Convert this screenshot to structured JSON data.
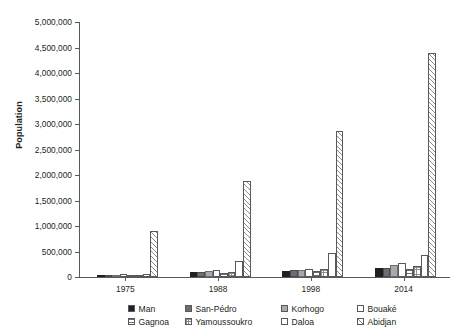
{
  "chart_data": {
    "type": "bar",
    "title": "",
    "xlabel": "",
    "ylabel": "Population",
    "categories": [
      "1975",
      "1988",
      "1998",
      "2014"
    ],
    "ylim": [
      0,
      5000000
    ],
    "ytick_values": [
      0,
      500000,
      1000000,
      1500000,
      2000000,
      2500000,
      3000000,
      3500000,
      4000000,
      4500000,
      5000000
    ],
    "ytick_labels": [
      "0",
      "500,000",
      "1,000,000",
      "1,500,000",
      "2,000,000",
      "2,500,000",
      "3,000,000",
      "3,500,000",
      "4,000,000",
      "4,500,000",
      "5,000,000"
    ],
    "grid": false,
    "legend_position": "bottom",
    "series": [
      {
        "name": "Man",
        "pattern": "solid-black",
        "values": [
          40000,
          90000,
          120000,
          180000
        ]
      },
      {
        "name": "San-Pédro",
        "pattern": "dark-gray",
        "values": [
          35000,
          100000,
          130000,
          175000
        ]
      },
      {
        "name": "Korhogo",
        "pattern": "mid-gray",
        "values": [
          45000,
          110000,
          145000,
          245000
        ]
      },
      {
        "name": "Bouaké",
        "pattern": "white",
        "values": [
          50000,
          130000,
          160000,
          275000
        ]
      },
      {
        "name": "Gagnoa",
        "pattern": "h-lines",
        "values": [
          30000,
          85000,
          125000,
          165000
        ]
      },
      {
        "name": "Yamoussoukro",
        "pattern": "crosshatch",
        "values": [
          30000,
          95000,
          155000,
          215000
        ]
      },
      {
        "name": "Daloa",
        "pattern": "white",
        "values": [
          60000,
          305000,
          465000,
          430000
        ]
      },
      {
        "name": "Abidjan",
        "pattern": "diagonal",
        "values": [
          900000,
          1880000,
          2860000,
          4390000
        ]
      }
    ]
  },
  "legend": {
    "row1": [
      "Man",
      "San-Pédro",
      "Korhogo",
      "Bouaké"
    ],
    "row2": [
      "Gagnoa",
      "Yamoussoukro",
      "Daloa",
      "Abidjan"
    ]
  }
}
